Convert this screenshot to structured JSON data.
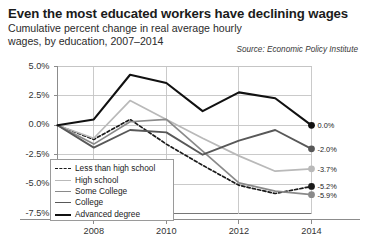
{
  "header": {
    "title": "Even the most educated workers have declining wages",
    "subtitle": "Cumulative percent change in real average hourly wages, by education, 2007–2014",
    "source": "Source: Economic Policy Institute"
  },
  "chart_data": {
    "type": "line",
    "title": "Even the most educated workers have declining wages",
    "subtitle": "Cumulative percent change in real average hourly wages, by education, 2007–2014",
    "xlabel": "",
    "ylabel": "",
    "x": [
      2007,
      2008,
      2009,
      2010,
      2011,
      2012,
      2013,
      2014
    ],
    "tick_labels_x": [
      "2008",
      "2010",
      "2012",
      "2014"
    ],
    "tick_values_x": [
      2008,
      2010,
      2012,
      2014
    ],
    "tick_labels_y": [
      "5.0%",
      "2.5%",
      "0.0%",
      "-2.5%",
      "-5.0%",
      "-7.5%"
    ],
    "tick_values_y": [
      5.0,
      2.5,
      0.0,
      -2.5,
      -5.0,
      -7.5
    ],
    "ylim": [
      -7.5,
      5.0
    ],
    "xlim": [
      2007,
      2014
    ],
    "grid": true,
    "legend_position": "lower-left",
    "series": [
      {
        "name": "Less than high school",
        "color": "#1a1a1a",
        "style": "dashed",
        "width": 1.7,
        "values": [
          0.0,
          -1.2,
          0.5,
          -1.6,
          -3.4,
          -5.1,
          -5.8,
          -5.2
        ],
        "end_label": "-5.2%",
        "end_value": -5.2
      },
      {
        "name": "High school",
        "color": "#b9b9b9",
        "style": "solid",
        "width": 1.7,
        "values": [
          0.0,
          -1.1,
          2.1,
          0.5,
          -1.1,
          -2.6,
          -3.9,
          -3.7
        ],
        "end_label": "-3.7%",
        "end_value": -3.7
      },
      {
        "name": "Some College",
        "color": "#8a8a8a",
        "style": "solid",
        "width": 1.7,
        "values": [
          0.0,
          -1.6,
          0.3,
          0.5,
          -2.2,
          -4.9,
          -5.6,
          -5.9
        ],
        "end_label": "-5.9%",
        "end_value": -5.9
      },
      {
        "name": "College",
        "color": "#585858",
        "style": "solid",
        "width": 1.9,
        "values": [
          0.0,
          -1.9,
          -0.4,
          -0.6,
          -2.5,
          -1.3,
          -0.4,
          -2.0
        ],
        "end_label": "-2.0%",
        "end_value": -2.0
      },
      {
        "name": "Advanced degree",
        "color": "#111111",
        "style": "solid",
        "width": 2.1,
        "values": [
          0.0,
          0.5,
          4.3,
          3.6,
          1.2,
          2.8,
          2.3,
          0.0
        ],
        "end_label": "0.0%",
        "end_value": 0.0
      }
    ]
  },
  "legend": {
    "items": [
      {
        "label": "Less than high school"
      },
      {
        "label": "High school"
      },
      {
        "label": "Some College"
      },
      {
        "label": "College"
      },
      {
        "label": "Advanced degree"
      }
    ]
  }
}
